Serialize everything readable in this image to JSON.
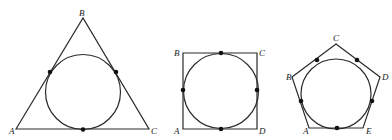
{
  "figures": [
    {
      "name": "triangle",
      "polygon": [
        [
          16,
          129
        ],
        [
          83,
          18
        ],
        [
          149,
          129
        ]
      ],
      "circle": {
        "cx": 83,
        "cy": 92,
        "r": 37.5
      },
      "tangent_points": [
        [
          50,
          72
        ],
        [
          116,
          72
        ],
        [
          83,
          129.5
        ]
      ],
      "labels": [
        {
          "text": "A",
          "x": 9,
          "y": 134
        },
        {
          "text": "B",
          "x": 79,
          "y": 16
        },
        {
          "text": "C",
          "x": 151,
          "y": 134
        }
      ]
    },
    {
      "name": "square",
      "polygon": [
        [
          183,
          53
        ],
        [
          257,
          53
        ],
        [
          257,
          129
        ],
        [
          183,
          129
        ]
      ],
      "circle": {
        "cx": 221,
        "cy": 91,
        "r": 37.5
      },
      "tangent_points": [
        [
          221,
          53
        ],
        [
          183,
          90
        ],
        [
          257,
          90
        ],
        [
          221,
          129
        ]
      ],
      "labels": [
        {
          "text": "B",
          "x": 174,
          "y": 56
        },
        {
          "text": "C",
          "x": 259,
          "y": 56
        },
        {
          "text": "A",
          "x": 174,
          "y": 134
        },
        {
          "text": "D",
          "x": 259,
          "y": 134
        }
      ]
    },
    {
      "name": "pentagon",
      "polygon": [
        [
          336,
          44
        ],
        [
          380,
          77
        ],
        [
          363,
          128
        ],
        [
          309,
          128
        ],
        [
          292,
          77
        ]
      ],
      "circle": {
        "cx": 336,
        "cy": 94,
        "r": 35
      },
      "tangent_points": [
        [
          317,
          60
        ],
        [
          357,
          60
        ],
        [
          301,
          101
        ],
        [
          372,
          101
        ],
        [
          337,
          128
        ]
      ],
      "labels": [
        {
          "text": "C",
          "x": 333,
          "y": 41
        },
        {
          "text": "B",
          "x": 286,
          "y": 80
        },
        {
          "text": "D",
          "x": 382,
          "y": 80
        },
        {
          "text": "A",
          "x": 303,
          "y": 134
        },
        {
          "text": "E",
          "x": 366,
          "y": 134
        }
      ]
    }
  ]
}
